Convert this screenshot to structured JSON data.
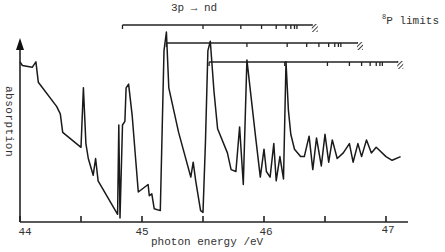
{
  "chart_data": {
    "type": "line",
    "title": "",
    "xlabel": "photon energy /eV",
    "ylabel": "absorption",
    "xlim": [
      44.0,
      47.2
    ],
    "xticks_major": [
      44,
      45,
      46,
      47
    ],
    "xticks_minor": [
      44.5,
      45.5,
      46.5
    ],
    "xtick_labels": [
      "44",
      "45",
      "46",
      "47"
    ],
    "y_units": "arbitrary (no tick labels)",
    "grid": false,
    "annotations": {
      "series_label": "3p → nd",
      "limits_label_sup": "8",
      "limits_label": "P limits",
      "rydberg_series": [
        {
          "start_eV": 44.84,
          "limit_eV": 46.4,
          "marks_eV": [
            44.84,
            45.5,
            45.81,
            45.98,
            46.1,
            46.18,
            46.22,
            46.25,
            46.27
          ]
        },
        {
          "start_eV": 45.2,
          "limit_eV": 46.77,
          "marks_eV": [
            45.2,
            45.86,
            46.19,
            46.35,
            46.45,
            46.53,
            46.58,
            46.61,
            46.63
          ]
        },
        {
          "start_eV": 45.55,
          "limit_eV": 47.1,
          "marks_eV": [
            45.55,
            46.17,
            46.52,
            46.7,
            46.8,
            46.87,
            46.92,
            46.95,
            46.97
          ]
        }
      ]
    },
    "series": [
      {
        "name": "absorption spectrum",
        "x": [
          44.0,
          44.02,
          44.1,
          44.13,
          44.15,
          44.3,
          44.33,
          44.35,
          44.5,
          44.52,
          44.54,
          44.56,
          44.6,
          44.62,
          44.64,
          44.8,
          44.81,
          44.82,
          44.84,
          44.86,
          44.87,
          44.89,
          44.92,
          44.95,
          44.97,
          45.05,
          45.06,
          45.08,
          45.1,
          45.15,
          45.18,
          45.2,
          45.22,
          45.3,
          45.4,
          45.42,
          45.44,
          45.48,
          45.5,
          45.52,
          45.54,
          45.56,
          45.59,
          45.62,
          45.7,
          45.73,
          45.77,
          45.8,
          45.83,
          45.86,
          45.93,
          45.97,
          46.0,
          46.02,
          46.05,
          46.08,
          46.1,
          46.13,
          46.16,
          46.18,
          46.2,
          46.22,
          46.25,
          46.3,
          46.33,
          46.37,
          46.4,
          46.43,
          46.47,
          46.5,
          46.53,
          46.56,
          46.6,
          46.65,
          46.7,
          46.73,
          46.77,
          46.8,
          46.84,
          46.88,
          46.92,
          47.0,
          47.05,
          47.12
        ],
        "y": [
          0.84,
          0.82,
          0.81,
          0.84,
          0.73,
          0.6,
          0.56,
          0.46,
          0.38,
          0.7,
          0.4,
          0.32,
          0.23,
          0.32,
          0.2,
          0.02,
          0.5,
          0.0,
          0.5,
          0.52,
          0.7,
          0.72,
          0.55,
          0.3,
          0.14,
          0.18,
          0.12,
          0.13,
          0.05,
          0.04,
          0.9,
          1.0,
          0.7,
          0.46,
          0.22,
          0.3,
          0.2,
          0.04,
          0.03,
          0.4,
          0.9,
          0.95,
          0.68,
          0.48,
          0.35,
          0.26,
          0.25,
          0.49,
          0.18,
          0.85,
          0.44,
          0.22,
          0.37,
          0.25,
          0.22,
          0.4,
          0.2,
          0.33,
          0.21,
          0.84,
          0.58,
          0.45,
          0.37,
          0.33,
          0.33,
          0.44,
          0.26,
          0.43,
          0.28,
          0.45,
          0.3,
          0.42,
          0.32,
          0.35,
          0.4,
          0.3,
          0.4,
          0.33,
          0.42,
          0.35,
          0.38,
          0.33,
          0.31,
          0.33
        ]
      }
    ]
  }
}
